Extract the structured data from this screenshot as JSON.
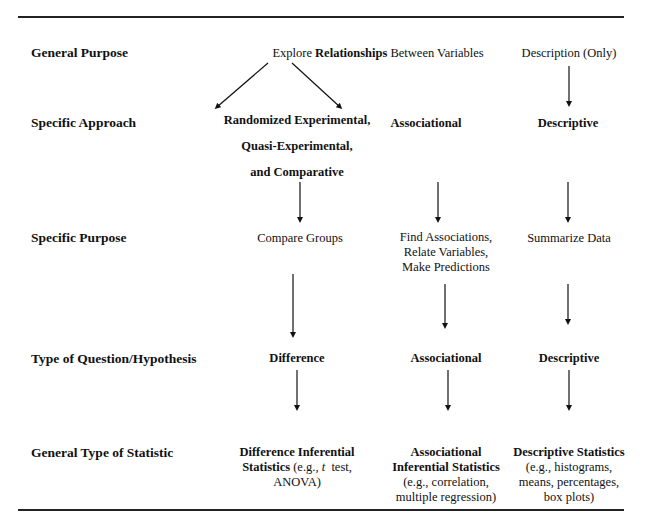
{
  "rows": [
    {
      "label": "General Purpose"
    },
    {
      "label": "Specific Approach"
    },
    {
      "label": "Specific Purpose"
    },
    {
      "label": "Type of Question/Hypothesis"
    },
    {
      "label": "General Type of Statistic"
    }
  ],
  "general_purpose": {
    "relationships_prefix": "Explore ",
    "relationships_bold": "Relationships",
    "relationships_suffix": " Between Variables",
    "description": "Description (Only)"
  },
  "specific_approach": {
    "experimental": [
      "Randomized Experimental,",
      "Quasi-Experimental,",
      "and Comparative"
    ],
    "associational": "Associational",
    "descriptive": "Descriptive"
  },
  "specific_purpose": {
    "compare": "Compare Groups",
    "associational": [
      "Find Associations,",
      "Relate Variables,",
      "Make Predictions"
    ],
    "descriptive": "Summarize Data"
  },
  "question_type": {
    "difference": "Difference",
    "associational": "Associational",
    "descriptive": "Descriptive"
  },
  "statistic_type": {
    "difference": {
      "line1": "Difference Inferential",
      "line2_bold": "Statistics",
      "line2_pre": " (e.g., ",
      "line2_italic": "t",
      "line2_post": "  test,",
      "line3": "ANOVA)"
    },
    "associational": {
      "line1": "Associational",
      "line2": "Inferential Statistics",
      "line3": "(e.g., correlation,",
      "line4": "multiple regression)"
    },
    "descriptive": {
      "line1": "Descriptive Statistics",
      "line2": "(e.g., histograms,",
      "line3": "means, percentages,",
      "line4": "box plots)"
    }
  }
}
